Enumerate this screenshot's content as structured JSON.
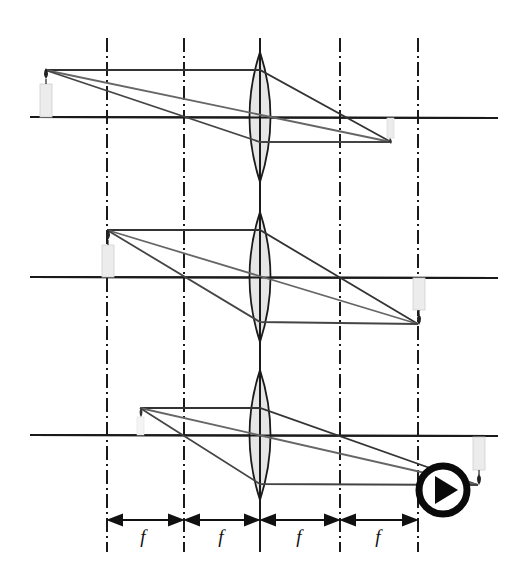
{
  "diagram": {
    "colors": {
      "line": "#1a1a1a",
      "ray_light": "#555555",
      "lens_fill": "#e6e6e6",
      "candle": "#ececec",
      "play": "#0a0a0a"
    },
    "focal_label": "f",
    "dimension_labels": [
      "f",
      "f",
      "f",
      "f"
    ],
    "verticals_x": [
      107,
      184,
      260,
      340,
      418
    ],
    "lens_x": 260,
    "axes_y": [
      117,
      277,
      435
    ],
    "panels": [
      {
        "name": "object-beyond-2f",
        "object_x": 45,
        "object_top_y": 70,
        "image_x": 391,
        "image_bottom_y": 142
      },
      {
        "name": "object-at-2f",
        "object_x": 107,
        "object_top_y": 230,
        "image_x": 418,
        "image_bottom_y": 324
      },
      {
        "name": "object-between-f-2f",
        "object_x": 140,
        "object_top_y": 408,
        "image_x": 478,
        "image_bottom_y": 485
      }
    ],
    "play_button": {
      "icon": "play-icon",
      "label": "Play"
    }
  }
}
